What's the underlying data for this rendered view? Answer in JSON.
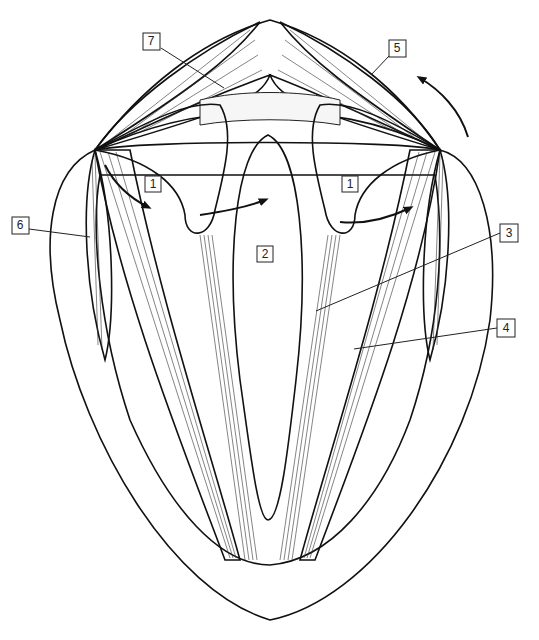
{
  "figure": {
    "type": "anatomical line drawing",
    "colors": {
      "line": "#111111",
      "background": "#ffffff",
      "stipple": "#8a8a8a",
      "crosshatch": "#bdbdbd"
    }
  },
  "labels": [
    {
      "id": "1",
      "text": "1",
      "x": 153,
      "y": 184
    },
    {
      "id": "1b",
      "text": "1",
      "x": 350,
      "y": 184
    },
    {
      "id": "2",
      "text": "2",
      "x": 265,
      "y": 254
    },
    {
      "id": "3",
      "text": "3",
      "x": 512,
      "y": 233
    },
    {
      "id": "4",
      "text": "4",
      "x": 509,
      "y": 327
    },
    {
      "id": "5",
      "text": "5",
      "x": 397,
      "y": 48
    },
    {
      "id": "6",
      "text": "6",
      "x": 20,
      "y": 225
    },
    {
      "id": "7",
      "text": "7",
      "x": 151,
      "y": 41
    }
  ],
  "arrows": [
    {
      "name": "rotation-arrow-top-right",
      "direction": "counterclockwise"
    },
    {
      "name": "rotation-arrow-left-arytenoid",
      "direction": "outward"
    },
    {
      "name": "rotation-arrow-right-arytenoid",
      "direction": "outward"
    },
    {
      "name": "abduction-arrow-left-muscle",
      "direction": "downward"
    }
  ]
}
